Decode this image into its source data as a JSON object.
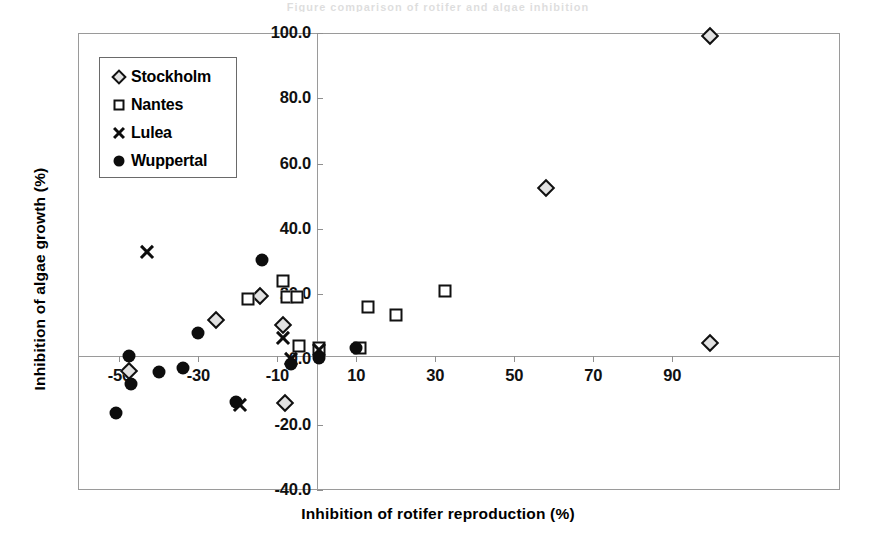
{
  "scan_artifact_text": "Figure comparison of rotifer and algae inhibition",
  "chart_data": {
    "type": "scatter",
    "title": "",
    "xlabel": "Inhibition of rotifer reproduction (%)",
    "ylabel": "Inhibition of algae growth (%)",
    "xlim": [
      -60.5,
      132.5
    ],
    "ylim": [
      -40.0,
      100.0
    ],
    "xticks": [
      -50,
      -30,
      -10,
      10,
      30,
      50,
      70,
      90
    ],
    "xtick_labels": [
      "-50",
      "-30",
      "-10",
      "10",
      "30",
      "50",
      "70",
      "90"
    ],
    "yticks": [
      -40.0,
      -20.0,
      0.0,
      20.0,
      40.0,
      60.0,
      80.0,
      100.0
    ],
    "ytick_labels": [
      "-40.0",
      "-20.0",
      "0.0",
      "20.0",
      "40.0",
      "60.0",
      "80.0",
      "100.0"
    ],
    "grid": false,
    "legend_position": "upper-left",
    "series": [
      {
        "name": "Stockholm",
        "marker": "diamond",
        "points": [
          {
            "x": -47.5,
            "y": -3.5
          },
          {
            "x": -25.5,
            "y": 12.0
          },
          {
            "x": -14.5,
            "y": 19.5
          },
          {
            "x": -8.5,
            "y": 10.5
          },
          {
            "x": -8.0,
            "y": -13.5
          },
          {
            "x": 58.0,
            "y": 52.5
          },
          {
            "x": 99.5,
            "y": 99.0
          },
          {
            "x": 99.5,
            "y": 5.0
          }
        ]
      },
      {
        "name": "Nantes",
        "marker": "square",
        "points": [
          {
            "x": -17.5,
            "y": 18.5
          },
          {
            "x": -8.5,
            "y": 24.0
          },
          {
            "x": -7.5,
            "y": 19.0
          },
          {
            "x": -5.0,
            "y": 19.0
          },
          {
            "x": -4.5,
            "y": 4.0
          },
          {
            "x": 0.5,
            "y": 3.5
          },
          {
            "x": 11.0,
            "y": 3.5
          },
          {
            "x": 13.0,
            "y": 16.0
          },
          {
            "x": 20.0,
            "y": 13.5
          },
          {
            "x": 32.5,
            "y": 21.0
          }
        ]
      },
      {
        "name": "Lulea",
        "marker": "cross",
        "points": [
          {
            "x": -43.0,
            "y": 33.0
          },
          {
            "x": -19.5,
            "y": -14.0
          },
          {
            "x": -8.5,
            "y": 6.5
          },
          {
            "x": -6.5,
            "y": 0.0
          },
          {
            "x": 0.5,
            "y": 3.0
          }
        ]
      },
      {
        "name": "Wuppertal",
        "marker": "circle",
        "points": [
          {
            "x": -51.0,
            "y": -16.5
          },
          {
            "x": -47.5,
            "y": 1.0
          },
          {
            "x": -47.0,
            "y": -7.5
          },
          {
            "x": -40.0,
            "y": -4.0
          },
          {
            "x": -34.0,
            "y": -2.5
          },
          {
            "x": -30.0,
            "y": 8.0
          },
          {
            "x": -20.5,
            "y": -13.0
          },
          {
            "x": -14.0,
            "y": 30.5
          },
          {
            "x": -6.5,
            "y": -1.5
          },
          {
            "x": 0.5,
            "y": 0.5
          },
          {
            "x": 10.0,
            "y": 3.5
          }
        ]
      }
    ]
  },
  "legend": {
    "items": [
      {
        "label": "Stockholm",
        "marker": "diamond"
      },
      {
        "label": "Nantes",
        "marker": "square"
      },
      {
        "label": "Lulea",
        "marker": "cross"
      },
      {
        "label": "Wuppertal",
        "marker": "circle"
      }
    ]
  }
}
